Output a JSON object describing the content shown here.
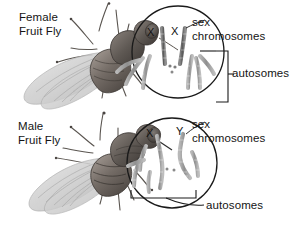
{
  "figure": {
    "background_color": "#ffffff",
    "width": 294,
    "height": 225
  },
  "panels": [
    {
      "id": "female",
      "organism_label": "Female\nFruit Fly",
      "karyotype_circle": {
        "cx": 178,
        "cy": 52,
        "r": 46
      },
      "sex_chromosome_letters": [
        "X",
        "X"
      ],
      "callouts": [
        {
          "name": "sex-chromosomes",
          "text": "sex\nchromosomes"
        },
        {
          "name": "autosomes",
          "text": "autosomes"
        }
      ]
    },
    {
      "id": "male",
      "organism_label": "Male\nFruit Fly",
      "karyotype_circle": {
        "cx": 172,
        "cy": 163,
        "r": 45
      },
      "sex_chromosome_letters": [
        "X",
        "Y"
      ],
      "callouts": [
        {
          "name": "sex-chromosomes",
          "text": "sex\nchromosomes"
        },
        {
          "name": "autosomes",
          "text": "autosomes"
        }
      ]
    }
  ],
  "labels": {
    "female_fly": "Female\nFruit Fly",
    "male_fly": "Male\nFruit Fly",
    "sex_chromosomes_top": "sex\nchromosomes",
    "sex_chromosomes_bottom": "sex\nchromosomes",
    "autosomes_top": "autosomes",
    "autosomes_bottom": "autosomes",
    "x_top_left": "X",
    "x_top_right": "X",
    "x_bottom": "X",
    "y_bottom": "Y"
  },
  "colors": {
    "text": "#141414",
    "line": "#1a1a1a",
    "chromosome_fill": "#9e9e9e",
    "chromosome_stroke": "#6e6e6e",
    "fly_body_dark": "#4a4542",
    "fly_body_mid": "#7a736e",
    "fly_wing": "#cfcfcf",
    "background": "#ffffff"
  }
}
